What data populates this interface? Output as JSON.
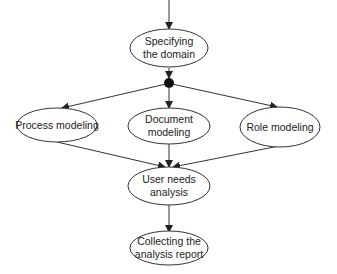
{
  "diagram": {
    "type": "flowchart",
    "colors": {
      "stroke": "#333333",
      "fill": "#ffffff",
      "text": "#222222",
      "junction": "#111111"
    },
    "nodes": [
      {
        "id": "specifying",
        "label_line1": "Specifying",
        "label_line2": "the domain"
      },
      {
        "id": "process",
        "label_line1": "Process modeling",
        "label_line2": ""
      },
      {
        "id": "document",
        "label_line1": "Document",
        "label_line2": "modeling"
      },
      {
        "id": "role",
        "label_line1": "Role modeling",
        "label_line2": ""
      },
      {
        "id": "userneeds",
        "label_line1": "User needs",
        "label_line2": "analysis"
      },
      {
        "id": "collecting",
        "label_line1": "Collecting the",
        "label_line2": "analysis report"
      }
    ],
    "edges": [
      {
        "from": "start",
        "to": "specifying"
      },
      {
        "from": "specifying",
        "to": "fork"
      },
      {
        "from": "fork",
        "to": "process"
      },
      {
        "from": "fork",
        "to": "document"
      },
      {
        "from": "fork",
        "to": "role"
      },
      {
        "from": "process",
        "to": "userneeds"
      },
      {
        "from": "document",
        "to": "userneeds"
      },
      {
        "from": "role",
        "to": "userneeds"
      },
      {
        "from": "userneeds",
        "to": "collecting"
      }
    ]
  }
}
